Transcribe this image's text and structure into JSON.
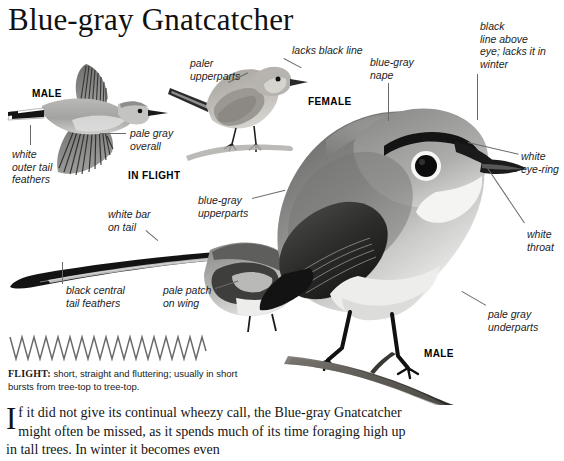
{
  "page": {
    "title": "Blue-gray Gnatcatcher",
    "width": 564,
    "height": 461,
    "background": "#ffffff"
  },
  "figures": {
    "flight_male": {
      "sex_label": "MALE",
      "mode_label": "IN FLIGHT",
      "annotations": [
        {
          "id": "white-outer-tail-feathers",
          "text": "white\nouter tail\nfeathers"
        },
        {
          "id": "pale-gray-overall",
          "text": "pale gray\noverall"
        }
      ]
    },
    "female_perched": {
      "sex_label": "FEMALE",
      "annotations": [
        {
          "id": "lacks-black-line",
          "text": "lacks black line"
        },
        {
          "id": "paler-upperparts",
          "text": "paler\nupperparts"
        }
      ]
    },
    "male_perched_small": {
      "annotations": [
        {
          "id": "white-bar-on-tail",
          "text": "white bar\non tail"
        },
        {
          "id": "black-central-tail-feathers",
          "text": "black central\ntail feathers"
        },
        {
          "id": "pale-patch-on-wing",
          "text": "pale patch\non wing"
        },
        {
          "id": "blue-gray-upperparts",
          "text": "blue-gray\nupperparts"
        }
      ]
    },
    "male_main": {
      "sex_label": "MALE",
      "annotations": [
        {
          "id": "blue-gray-nape",
          "text": "blue-gray\nnape"
        },
        {
          "id": "black-line-above-eye",
          "text": "black\nline above\neye; lacks it in\nwinter"
        },
        {
          "id": "white-eye-ring",
          "text": "white\neye-ring"
        },
        {
          "id": "white-throat",
          "text": "white\nthroat"
        },
        {
          "id": "pale-gray-underparts",
          "text": "pale gray\nunderparts"
        }
      ]
    }
  },
  "flight_section": {
    "heading": "FLIGHT:",
    "description": " short, straight and fluttering; usually in short bursts from tree-top to tree-top.",
    "pattern": "zigzag"
  },
  "body_text": {
    "dropcap": "I",
    "paragraph": "f it did not give its continual wheezy call, the Blue-gray Gnatcatcher might often be missed, as it spends much of its time foraging high up in tall trees. In winter it becomes even"
  },
  "colors": {
    "text": "#1a1a1a",
    "leader_line": "#6a6a6a",
    "plumage_upper": "#8f8f8f",
    "plumage_dark": "#3a3a3a",
    "plumage_pale": "#e4e4e2",
    "black": "#111111",
    "branch": "#5e5a55"
  }
}
